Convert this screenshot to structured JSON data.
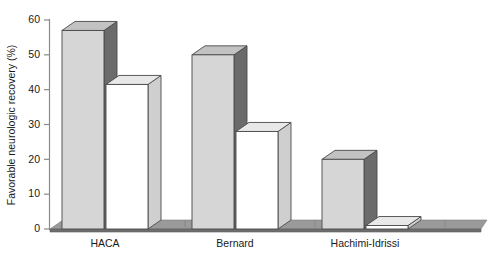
{
  "chart_data": {
    "type": "bar",
    "title": "",
    "subtitle": "",
    "xlabel": "",
    "ylabel": "Favorable neurologic recovery (%)",
    "categories": [
      "HACA",
      "Bernard",
      "Hachimi-Idrissi"
    ],
    "series": [
      {
        "name": "Hypothermia",
        "values": [
          57,
          50,
          20
        ]
      },
      {
        "name": "Normothermia",
        "values": [
          41.5,
          28,
          1
        ]
      }
    ],
    "ylim": [
      0,
      60
    ],
    "yticks": [
      0,
      10,
      20,
      30,
      40,
      50,
      60
    ],
    "ytick_labels": [
      "0",
      "10",
      "20",
      "30",
      "40",
      "50",
      "60"
    ],
    "grid": false,
    "legend": "none",
    "style": "3d-bars",
    "colors": {
      "series1_face": "#d6d6d6",
      "series1_side": "#6b6b6b",
      "series1_top": "#c2c2c2",
      "series2_face": "#ffffff",
      "series2_side": "#cfcfcf",
      "series2_top": "#e8e8e8",
      "axis": "#8a8a8a",
      "text": "#1a1a1a",
      "floor_front": "#6e6e6e",
      "floor_top": "#9a9a9a"
    }
  }
}
